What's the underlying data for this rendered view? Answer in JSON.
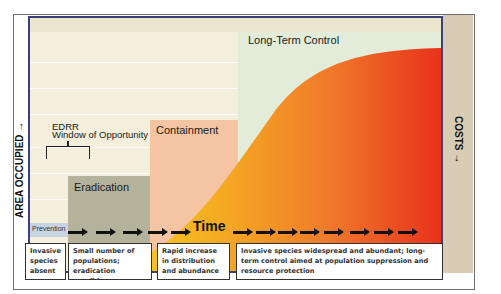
{
  "diagram": {
    "axes": {
      "left_label": "AREA OCCUPIED →",
      "right_label": "COSTS →",
      "time_label": "Time"
    },
    "regions": {
      "prevention": "Prevention",
      "eradication": "Eradication",
      "containment": "Containment",
      "long_term_control": "Long-Term Control",
      "edrr_line1": "EDRR",
      "edrr_line2": "Window of Opportunity"
    },
    "stages": [
      {
        "text": "Invasive species absent"
      },
      {
        "text": "Small number of populations; eradication possible"
      },
      {
        "text": "Rapid increase in distribution and abundance"
      },
      {
        "text": "Invasive species widespread and abundant; long-term control aimed at population suppression and resource protection"
      }
    ],
    "colors": {
      "plot_border": "#3b3f7a",
      "background": "#f3efdc",
      "long_term_control_bg": "#e2ecd8",
      "containment_bg": "#f5c4a2",
      "eradication_bg": "#b5b29c",
      "curve_start": "#f6c21a",
      "curve_mid": "#f2892a",
      "curve_end": "#e8361c",
      "costs_strip": "#d8ccb4"
    }
  }
}
